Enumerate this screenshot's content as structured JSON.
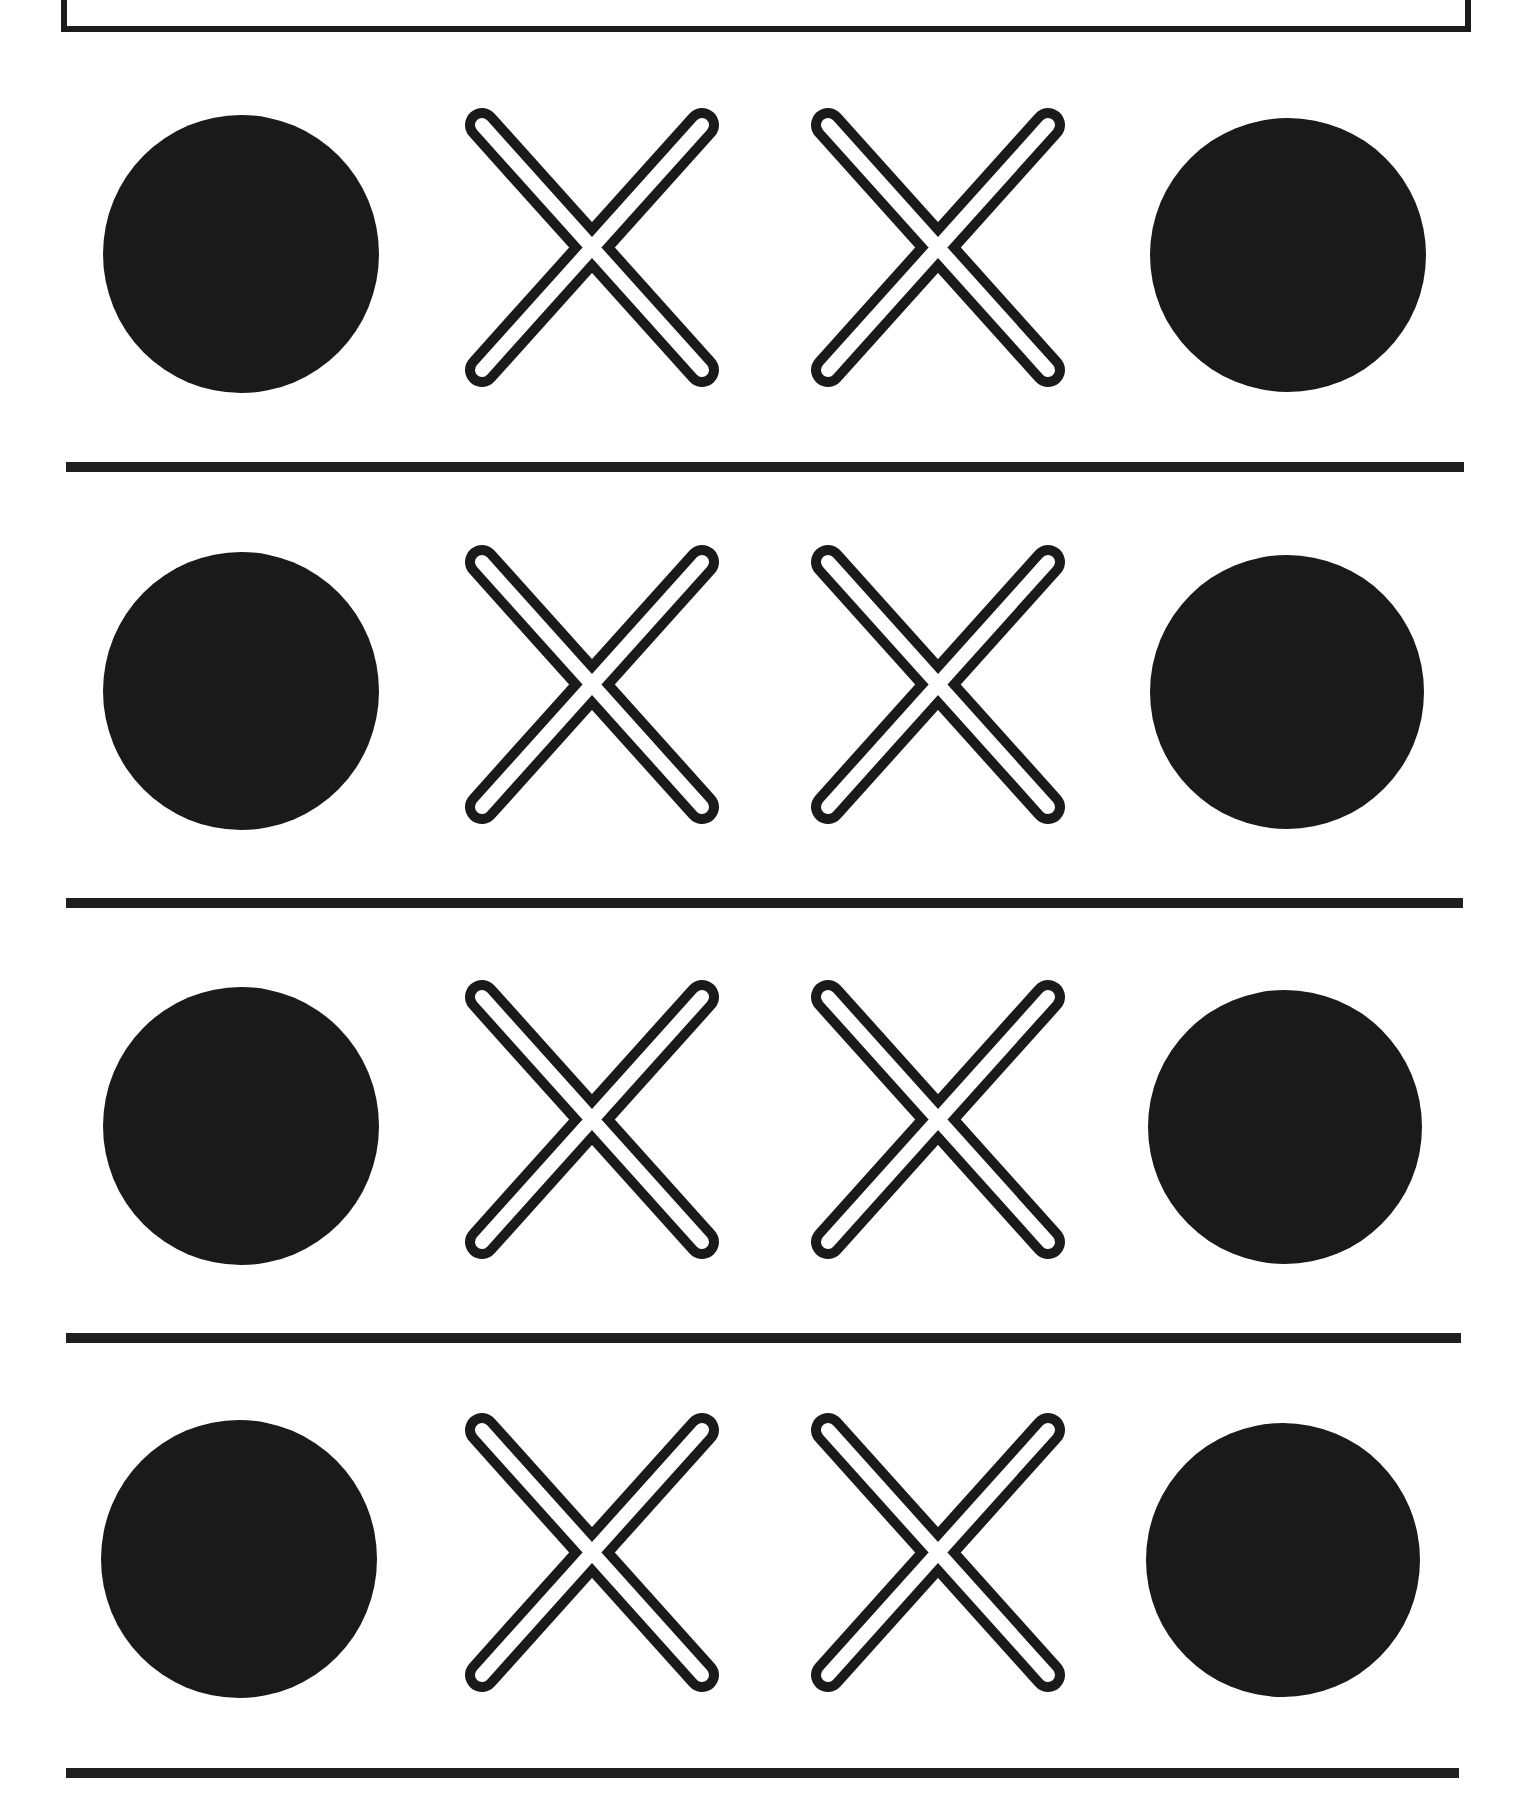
{
  "worksheet": {
    "type": "pattern-sequence",
    "colors": {
      "ink": "#1a1a1a",
      "paper": "#ffffff"
    },
    "rows": [
      {
        "pattern": [
          "filled-circle",
          "outlined-x",
          "outlined-x",
          "filled-circle"
        ]
      },
      {
        "pattern": [
          "filled-circle",
          "outlined-x",
          "outlined-x",
          "filled-circle"
        ]
      },
      {
        "pattern": [
          "filled-circle",
          "outlined-x",
          "outlined-x",
          "filled-circle"
        ]
      },
      {
        "pattern": [
          "filled-circle",
          "outlined-x",
          "outlined-x",
          "filled-circle"
        ]
      }
    ]
  }
}
